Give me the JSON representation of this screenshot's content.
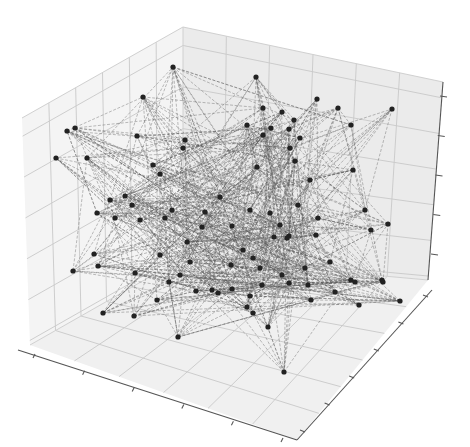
{
  "chart_data": {
    "type": "scatter",
    "subtype": "3d-network-graph",
    "title": "",
    "xlabel": "",
    "ylabel": "",
    "zlabel": "",
    "tick_labels_visible": false,
    "grid": true,
    "legend": null,
    "node_color": "#222222",
    "edge_color": "#555555",
    "edge_style": "dashed",
    "pane_color": "#f2f2f2",
    "nodes_screen_xy": [
      [
        173,
        67
      ],
      [
        256,
        77
      ],
      [
        143,
        97
      ],
      [
        317,
        99
      ],
      [
        338,
        108
      ],
      [
        392,
        109
      ],
      [
        75,
        128
      ],
      [
        67,
        131
      ],
      [
        137,
        136
      ],
      [
        185,
        140
      ],
      [
        263,
        108
      ],
      [
        282,
        112
      ],
      [
        247,
        125
      ],
      [
        271,
        128
      ],
      [
        294,
        120
      ],
      [
        289,
        129
      ],
      [
        351,
        125
      ],
      [
        300,
        138
      ],
      [
        263,
        135
      ],
      [
        56,
        158
      ],
      [
        87,
        158
      ],
      [
        153,
        165
      ],
      [
        183,
        148
      ],
      [
        290,
        148
      ],
      [
        353,
        170
      ],
      [
        257,
        167
      ],
      [
        295,
        161
      ],
      [
        160,
        174
      ],
      [
        310,
        180
      ],
      [
        125,
        196
      ],
      [
        132,
        205
      ],
      [
        172,
        210
      ],
      [
        165,
        218
      ],
      [
        205,
        212
      ],
      [
        250,
        210
      ],
      [
        220,
        197
      ],
      [
        270,
        213
      ],
      [
        280,
        225
      ],
      [
        298,
        205
      ],
      [
        318,
        218
      ],
      [
        289,
        236
      ],
      [
        287,
        238
      ],
      [
        232,
        226
      ],
      [
        202,
        227
      ],
      [
        187,
        242
      ],
      [
        110,
        200
      ],
      [
        97,
        213
      ],
      [
        115,
        218
      ],
      [
        140,
        220
      ],
      [
        365,
        210
      ],
      [
        388,
        224
      ],
      [
        371,
        230
      ],
      [
        243,
        250
      ],
      [
        274,
        237
      ],
      [
        316,
        235
      ],
      [
        253,
        258
      ],
      [
        73,
        271
      ],
      [
        94,
        254
      ],
      [
        98,
        266
      ],
      [
        135,
        273
      ],
      [
        160,
        255
      ],
      [
        180,
        275
      ],
      [
        190,
        262
      ],
      [
        231,
        265
      ],
      [
        260,
        268
      ],
      [
        282,
        275
      ],
      [
        305,
        268
      ],
      [
        330,
        262
      ],
      [
        351,
        280
      ],
      [
        355,
        282
      ],
      [
        382,
        280
      ],
      [
        383,
        282
      ],
      [
        262,
        285
      ],
      [
        289,
        283
      ],
      [
        308,
        285
      ],
      [
        335,
        292
      ],
      [
        247,
        307
      ],
      [
        253,
        313
      ],
      [
        311,
        300
      ],
      [
        103,
        313
      ],
      [
        134,
        316
      ],
      [
        157,
        300
      ],
      [
        169,
        282
      ],
      [
        196,
        291
      ],
      [
        212,
        290
      ],
      [
        218,
        293
      ],
      [
        232,
        289
      ],
      [
        250,
        296
      ],
      [
        359,
        305
      ],
      [
        400,
        301
      ],
      [
        268,
        327
      ],
      [
        178,
        337
      ],
      [
        284,
        372
      ]
    ],
    "node_count": 93,
    "axes": {
      "x": {
        "ticks": 6,
        "tick_labels": []
      },
      "y": {
        "ticks": 6,
        "tick_labels": []
      },
      "z": {
        "ticks": 5,
        "tick_labels": []
      }
    }
  }
}
